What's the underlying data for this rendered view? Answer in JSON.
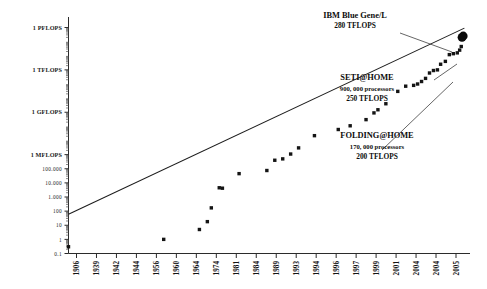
{
  "chart_data": {
    "type": "scatter",
    "title": "",
    "subtitle": "",
    "xlabel": "",
    "ylabel": "",
    "grid": false,
    "legend_position": "none",
    "yscale": "log",
    "ylim_label_range": [
      "0.1",
      "1 PFLOPS"
    ],
    "y_tick_labels": [
      "1 PFLOPS",
      "1 TFLOPS",
      "1 GFLOPS",
      "1 MFLOPS",
      "100.000",
      "10.000",
      "1.000",
      "100",
      "10",
      "1",
      "0.1"
    ],
    "y_tick_values": [
      1000000000000000.0,
      1000000000000.0,
      1000000000.0,
      1000000.0,
      100000,
      10000,
      1000,
      100,
      10,
      1,
      0.1
    ],
    "x_tick_labels": [
      "1906",
      "1939",
      "1942",
      "1944",
      "1956",
      "1960",
      "1964",
      "1974",
      "1981",
      "1984",
      "1989",
      "1993",
      "1994",
      "1996",
      "1997",
      "1999",
      "2001",
      "2004",
      "2004",
      "2005"
    ],
    "series": [
      {
        "name": "Fastest computer performance (FLOPS)",
        "marker": "square",
        "color": "#141414",
        "points": [
          {
            "x": 1906,
            "y": 0.3
          },
          {
            "x": 1930,
            "y": 1
          },
          {
            "x": 1939,
            "y": 5
          },
          {
            "x": 1941,
            "y": 18
          },
          {
            "x": 1942,
            "y": 170
          },
          {
            "x": 1944,
            "y": 4500
          },
          {
            "x": 1944.8,
            "y": 4200
          },
          {
            "x": 1949,
            "y": 45000
          },
          {
            "x": 1956,
            "y": 75000
          },
          {
            "x": 1958,
            "y": 400000
          },
          {
            "x": 1960,
            "y": 500000
          },
          {
            "x": 1962,
            "y": 1100000
          },
          {
            "x": 1964,
            "y": 3000000
          },
          {
            "x": 1968,
            "y": 22000000
          },
          {
            "x": 1974,
            "y": 60000000
          },
          {
            "x": 1977,
            "y": 110000000
          },
          {
            "x": 1981,
            "y": 300000000
          },
          {
            "x": 1983,
            "y": 900000000
          },
          {
            "x": 1984,
            "y": 1500000000
          },
          {
            "x": 1986,
            "y": 4000000000
          },
          {
            "x": 1989,
            "y": 30000000000
          },
          {
            "x": 1991,
            "y": 70000000000
          },
          {
            "x": 1993,
            "y": 80000000000
          },
          {
            "x": 1994,
            "y": 100000000000
          },
          {
            "x": 1995,
            "y": 150000000000
          },
          {
            "x": 1996,
            "y": 250000000000
          },
          {
            "x": 1997,
            "y": 600000000000
          },
          {
            "x": 1998,
            "y": 900000000000
          },
          {
            "x": 1999,
            "y": 1000000000000
          },
          {
            "x": 1999.8,
            "y": 2500000000000
          },
          {
            "x": 2001,
            "y": 4000000000000
          },
          {
            "x": 2002,
            "y": 12000000000000
          },
          {
            "x": 2003,
            "y": 14000000000000
          },
          {
            "x": 2004,
            "y": 16000000000000
          },
          {
            "x": 2004.6,
            "y": 25000000000000
          },
          {
            "x": 2005,
            "y": 45000000000000
          },
          {
            "x": 2005.6,
            "y": 180000000000000
          }
        ]
      },
      {
        "name": "Distributed computing projects",
        "marker": "circle",
        "color": "#0a0a0a",
        "points": [
          {
            "x": 2005.5,
            "y": 250000000000000,
            "label": "SETI@HOME"
          },
          {
            "x": 2005.2,
            "y": 200000000000000,
            "label": "FOLDING@HOME"
          }
        ]
      }
    ],
    "trendline": {
      "name": "Exponential trend (Moore's law fit)",
      "from": {
        "x": 1906,
        "y": 60
      },
      "to": {
        "x": 2005.8,
        "y": 900000000000000
      }
    },
    "annotations": [
      {
        "id": "ibm-blue-gene",
        "lines": [
          "IBM Blue Gene/L",
          "280 TFLOPS"
        ],
        "target": "square-top-right"
      },
      {
        "id": "seti-at-home",
        "lines": [
          "SETI@HOME",
          "900, 000 processors",
          "250 TFLOPS"
        ],
        "target": "circle-upper"
      },
      {
        "id": "folding-at-home",
        "lines": [
          "FOLDING@HOME",
          "170, 000 processors",
          "200 TFLOPS"
        ],
        "target": "circle-lower"
      }
    ]
  },
  "colors": {
    "background": "#ffffff",
    "ink": "#141414",
    "axis": "#2b2b2b",
    "trend": "#1c1c1c"
  }
}
